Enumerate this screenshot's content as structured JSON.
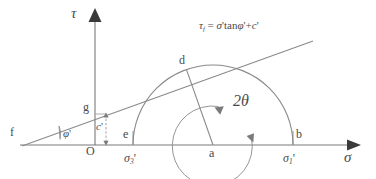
{
  "figure": {
    "stroke_color": "#7a7a7a",
    "text_color": "#4a4a4a",
    "background": "#ffffff"
  },
  "axes": {
    "vertical_label": "τ",
    "horizontal_label": "σ",
    "origin_label": "O"
  },
  "envelope": {
    "equation_tau": "τ",
    "equation_tau_sub": "f",
    "equation_eq": "=",
    "equation_sigma": "σ",
    "equation_prime1": "'",
    "equation_tan": "tan",
    "equation_phi": "φ",
    "equation_prime2": "'",
    "equation_plus": "+",
    "equation_c": "c",
    "equation_prime3": "'",
    "equation_full": "τ_f = σ' tanφ' + c'",
    "angle_label_phi": "φ",
    "angle_label_phi_prime": "'",
    "intercept_label_c": "c",
    "intercept_label_c_prime": "'",
    "apex_point": "f",
    "intercept_point": "g"
  },
  "circle": {
    "tangent_point": "d",
    "center_point": "a",
    "left_point": "e",
    "right_point": "b",
    "angle_label": "2θ",
    "sigma3_sym": "σ",
    "sigma3_sub": "3",
    "sigma3_prime": "'",
    "sigma1_sym": "σ",
    "sigma1_sub": "1",
    "sigma1_prime": "'"
  }
}
